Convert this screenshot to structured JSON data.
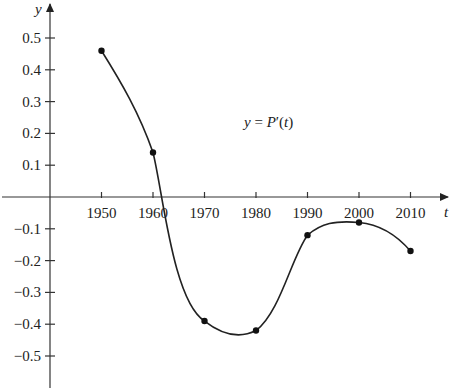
{
  "chart_data": {
    "type": "line",
    "title": "",
    "annotation": "y = P′(t)",
    "xlabel": "t",
    "ylabel": "y",
    "x": [
      1950,
      1960,
      1970,
      1980,
      1990,
      2000,
      2010
    ],
    "series": [
      {
        "name": "P′(t)",
        "values": [
          0.46,
          0.14,
          -0.39,
          -0.42,
          -0.12,
          -0.08,
          -0.17
        ]
      }
    ],
    "x_ticks": [
      "1950",
      "1960",
      "1970",
      "1980",
      "1990",
      "2000",
      "2010"
    ],
    "y_ticks": [
      "0.5",
      "0.4",
      "0.3",
      "0.2",
      "0.1",
      "−0.1",
      "−0.2",
      "−0.3",
      "−0.4",
      "−0.5"
    ],
    "xlim": [
      1940,
      2020
    ],
    "ylim": [
      -0.6,
      0.55
    ],
    "grid": false,
    "legend": "none",
    "smooth_curve": true
  },
  "labels": {
    "y_axis": "y",
    "x_axis": "t",
    "annotation": "y = P′(t)"
  }
}
